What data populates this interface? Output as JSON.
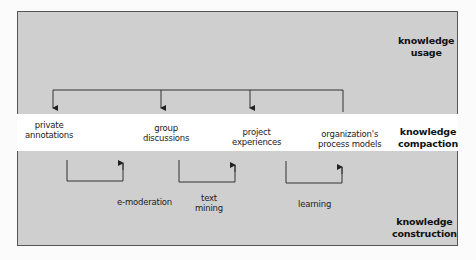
{
  "layers": {
    "usage": {
      "line1": "knowledge",
      "line2": "usage"
    },
    "compaction": {
      "line1": "knowledge",
      "line2": "compaction"
    },
    "construction": {
      "line1": "knowledge",
      "line2": "construction"
    }
  },
  "artifacts": [
    {
      "line1": "private",
      "line2": "annotations"
    },
    {
      "line1": "group",
      "line2": "discussions"
    },
    {
      "line1": "project",
      "line2": "experiences"
    },
    {
      "line1": "organization's",
      "line2": "process models"
    }
  ],
  "processes": [
    {
      "line1": "e-moderation",
      "line2": ""
    },
    {
      "line1": "text",
      "line2": "mining"
    },
    {
      "line1": "learning",
      "line2": ""
    }
  ],
  "colors": {
    "background": "#cfcfcf",
    "band": "#ffffff",
    "line": "#333333"
  }
}
